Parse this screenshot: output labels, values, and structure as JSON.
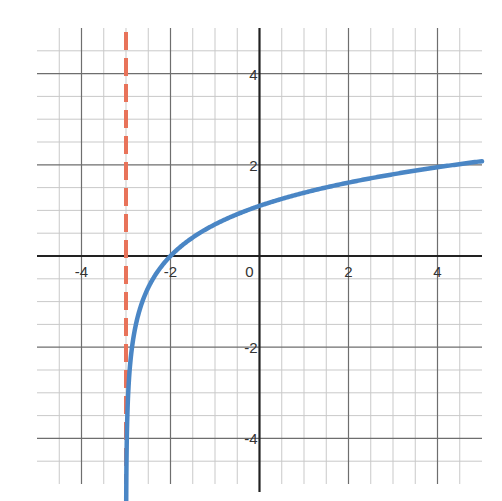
{
  "chart_data": {
    "type": "line",
    "title": "",
    "xlabel": "",
    "ylabel": "",
    "xlim": [
      -5,
      5
    ],
    "ylim": [
      -5,
      5
    ],
    "grid": true,
    "grid_minor_step": 0.5,
    "grid_major_step": 2,
    "x_ticks": [
      -4,
      -2,
      0,
      2,
      4
    ],
    "y_ticks": [
      -4,
      -2,
      2,
      4
    ],
    "x_tick_labels": [
      "-4",
      "-2",
      "0",
      "2",
      "4"
    ],
    "y_tick_labels": [
      "-4",
      "-2",
      "2",
      "4"
    ],
    "legend": null,
    "series": [
      {
        "name": "y = ln(x + 3)",
        "style": "solid",
        "color": "#4a86c5",
        "function": "ln(x+3)",
        "x": [
          -2.995,
          -2.99,
          -2.98,
          -2.95,
          -2.9,
          -2.8,
          -2.6,
          -2.4,
          -2.2,
          -2.0,
          -1.5,
          -1.0,
          -0.5,
          0,
          0.5,
          1,
          1.5,
          2,
          2.5,
          3,
          3.5,
          4,
          4.5,
          5
        ],
        "y": [
          -5.3,
          -4.61,
          -3.91,
          -3.0,
          -2.3,
          -1.61,
          -0.92,
          -0.51,
          -0.22,
          0.0,
          0.41,
          0.69,
          0.92,
          1.1,
          1.25,
          1.39,
          1.5,
          1.61,
          1.7,
          1.79,
          1.87,
          1.95,
          2.01,
          2.08
        ]
      },
      {
        "name": "vertical asymptote x = -3",
        "style": "dashed",
        "color": "#e8735a",
        "x": [
          -3,
          -3
        ],
        "y": [
          -5,
          5
        ]
      }
    ],
    "annotations": [
      {
        "type": "vertical_asymptote",
        "x": -3
      },
      {
        "type": "x_intercept",
        "point": [
          -2,
          0
        ]
      },
      {
        "type": "y_intercept",
        "point": [
          0,
          1.1
        ]
      }
    ]
  },
  "colors": {
    "curve": "#4a86c5",
    "asymptote": "#e8735a",
    "grid_minor": "#c9c9c9",
    "grid_major": "#6e6e6e",
    "axis": "#222222",
    "tick_text": "#333333"
  }
}
